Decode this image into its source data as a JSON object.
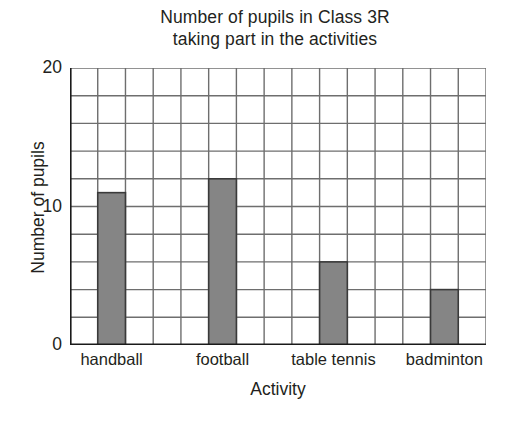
{
  "chart_data": {
    "type": "bar",
    "title": "Number of pupils in Class 3R taking part in the activities",
    "title_lines": [
      "Number of pupils in Class 3R",
      "taking part in the activities"
    ],
    "categories": [
      "handball",
      "football",
      "table tennis",
      "badminton"
    ],
    "values": [
      11,
      12,
      6,
      4
    ],
    "xlabel": "Activity",
    "ylabel": "Number of pupils",
    "ylim": [
      0,
      20
    ],
    "ytick_labels": [
      "0",
      "10",
      "20"
    ],
    "ytick_values": [
      0,
      10,
      20
    ],
    "y_gridline_step": 2,
    "x_gridline_count": 15,
    "grid": true,
    "legend": "none",
    "bar_color": "#858585",
    "bar_edge_color": "#3a3a3a",
    "grid_color": "#6e6e6e",
    "axis_color": "#1a1a1a",
    "background_color": "#ffffff"
  }
}
